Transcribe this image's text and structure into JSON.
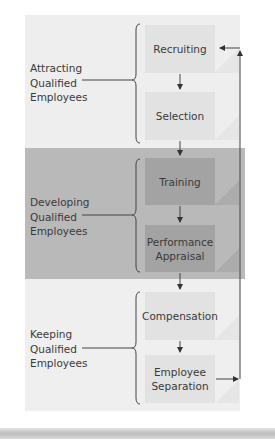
{
  "diagram": {
    "groups": [
      {
        "label_lines": [
          "Attracting",
          "Qualified",
          "Employees"
        ],
        "shade": "light",
        "steps": [
          "Recruiting",
          "Selection"
        ]
      },
      {
        "label_lines": [
          "Developing",
          "Qualified",
          "Employees"
        ],
        "shade": "dark",
        "steps": [
          "Training",
          "Performance Appraisal"
        ]
      },
      {
        "label_lines": [
          "Keeping",
          "Qualified",
          "Employees"
        ],
        "shade": "light",
        "steps": [
          "Compensation",
          "Employee Separation"
        ]
      }
    ],
    "steps": {
      "s1": "Recruiting",
      "s2": "Selection",
      "s3": "Training",
      "s4a": "Performance",
      "s4b": "Appraisal",
      "s5": "Compensation",
      "s6a": "Employee",
      "s6b": "Separation"
    },
    "labels": {
      "g1": [
        "Attracting",
        "Qualified",
        "Employees"
      ],
      "g2": [
        "Developing",
        "Qualified",
        "Employees"
      ],
      "g3": [
        "Keeping",
        "Qualified",
        "Employees"
      ]
    },
    "feedback_loop": {
      "from": "Employee Separation",
      "to": "Recruiting"
    },
    "colors": {
      "light_band": "#eeeeee",
      "dark_band": "#b9b9b9",
      "light_box": "#e2e2e2",
      "dark_box": "#a3a3a3",
      "line": "#444444"
    }
  }
}
